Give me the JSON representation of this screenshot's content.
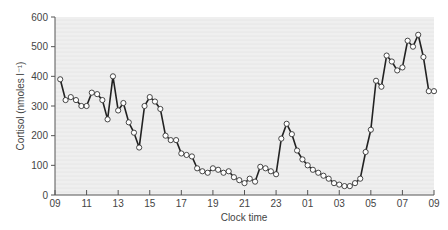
{
  "chart_data": {
    "type": "line",
    "title": "",
    "xlabel": "Clock time",
    "ylabel": "Cortisol (nmoles l⁻¹)",
    "ylim": [
      0,
      600
    ],
    "xlim_hours": [
      0,
      24
    ],
    "yticks": [
      0,
      100,
      200,
      300,
      400,
      500,
      600
    ],
    "xtick_labels": [
      "09",
      "11",
      "13",
      "15",
      "17",
      "19",
      "21",
      "23",
      "01",
      "03",
      "05",
      "07",
      "09"
    ],
    "grid": false,
    "legend": null,
    "series": [
      {
        "name": "Cortisol",
        "marker": "open-circle",
        "color": "#222222",
        "hours_since_0900": [
          0.33,
          0.67,
          1.0,
          1.33,
          1.67,
          2.0,
          2.33,
          2.67,
          3.0,
          3.33,
          3.67,
          4.0,
          4.33,
          4.67,
          5.0,
          5.33,
          5.67,
          6.0,
          6.33,
          6.67,
          7.0,
          7.33,
          7.67,
          8.0,
          8.33,
          8.67,
          9.0,
          9.33,
          9.67,
          10.0,
          10.33,
          10.67,
          11.0,
          11.33,
          11.67,
          12.0,
          12.33,
          12.67,
          13.0,
          13.33,
          13.67,
          14.0,
          14.33,
          14.67,
          15.0,
          15.33,
          15.67,
          16.0,
          16.33,
          16.67,
          17.0,
          17.33,
          17.67,
          18.0,
          18.33,
          18.67,
          19.0,
          19.33,
          19.67,
          20.0,
          20.33,
          20.67,
          21.0,
          21.33,
          21.67,
          22.0,
          22.33,
          22.67,
          23.0,
          23.33,
          23.67,
          24.0
        ],
        "values": [
          390,
          320,
          330,
          320,
          300,
          300,
          345,
          340,
          320,
          255,
          400,
          285,
          310,
          245,
          210,
          160,
          300,
          330,
          315,
          290,
          200,
          185,
          185,
          140,
          135,
          130,
          90,
          80,
          75,
          90,
          85,
          75,
          80,
          60,
          50,
          40,
          55,
          45,
          95,
          90,
          80,
          70,
          190,
          240,
          205,
          150,
          120,
          100,
          85,
          75,
          65,
          55,
          40,
          35,
          30,
          30,
          40,
          55,
          145,
          220,
          385,
          365,
          470,
          450,
          420,
          430,
          520,
          500,
          540,
          465,
          350,
          350
        ]
      }
    ]
  },
  "axes": {
    "x_title": "Clock time",
    "y_title": "Cortisol (nmoles l⁻¹)"
  }
}
